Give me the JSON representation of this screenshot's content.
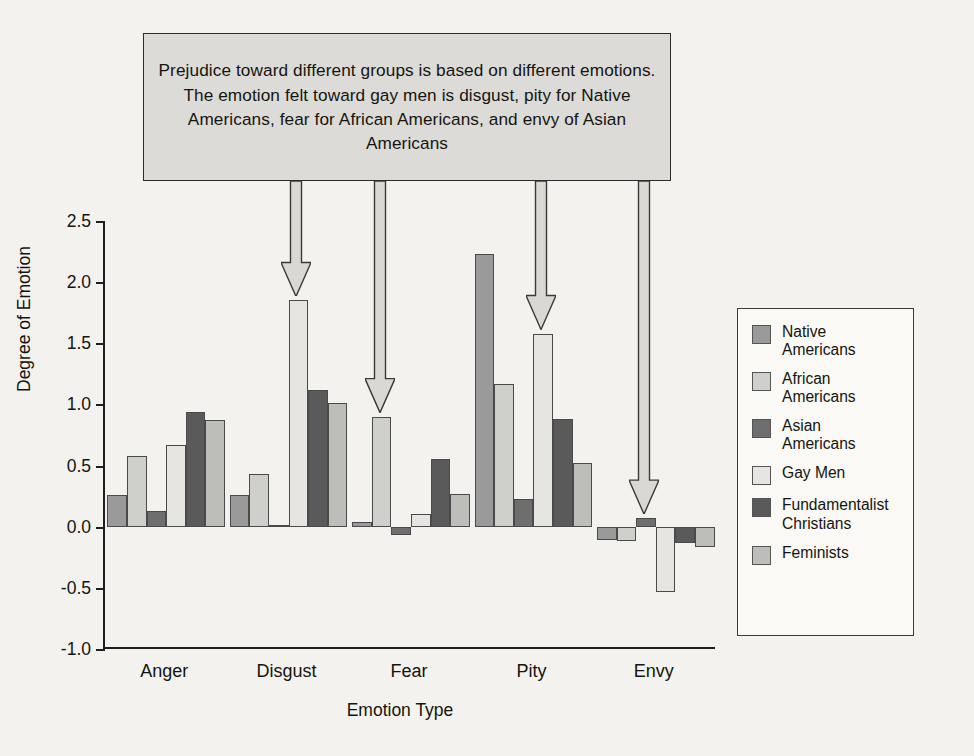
{
  "annotation": {
    "text": "Prejudice toward different groups is based on different emotions. The emotion felt toward gay men is disgust, pity for Native Americans, fear for African Americans, and envy of Asian Americans"
  },
  "legend": {
    "entries": [
      {
        "label": "Native\nAmericans",
        "color": "#9a9a9a"
      },
      {
        "label": "African\nAmericans",
        "color": "#cfcfcb"
      },
      {
        "label": "Asian\nAmericans",
        "color": "#6e6e6e"
      },
      {
        "label": "Gay Men",
        "color": "#e6e5e1"
      },
      {
        "label": "Fundamentalist\nChristians",
        "color": "#5a5a5a"
      },
      {
        "label": "Feminists",
        "color": "#bdbdb9"
      }
    ]
  },
  "chart_data": {
    "type": "bar",
    "title": "",
    "xlabel": "Emotion Type",
    "ylabel": "Degree of Emotion",
    "ylim": [
      -1.0,
      2.5
    ],
    "yticks": [
      2.5,
      2.0,
      1.5,
      1.0,
      0.5,
      0.0,
      -0.5,
      -1.0
    ],
    "ytick_labels": [
      "2.5",
      "2.0",
      "1.5",
      "1.0",
      "0.5",
      "0.0",
      "-0.5",
      "-1.0"
    ],
    "grid": false,
    "legend_position": "right",
    "categories": [
      "Anger",
      "Disgust",
      "Fear",
      "Pity",
      "Envy"
    ],
    "series": [
      {
        "name": "Native Americans",
        "color": "#9a9a9a",
        "values": [
          0.26,
          0.26,
          0.04,
          2.23,
          -0.11
        ]
      },
      {
        "name": "African Americans",
        "color": "#cfcfcb",
        "values": [
          0.58,
          0.43,
          0.9,
          1.17,
          -0.12
        ]
      },
      {
        "name": "Asian Americans",
        "color": "#6e6e6e",
        "values": [
          0.13,
          0.01,
          -0.07,
          0.23,
          0.07
        ]
      },
      {
        "name": "Gay Men",
        "color": "#e6e5e1",
        "values": [
          0.67,
          1.85,
          0.1,
          1.58,
          -0.53
        ]
      },
      {
        "name": "Fundamentalist Christians",
        "color": "#5a5a5a",
        "values": [
          0.94,
          1.12,
          0.55,
          0.88,
          -0.13
        ]
      },
      {
        "name": "Feminists",
        "color": "#bdbdb9",
        "values": [
          0.87,
          1.01,
          0.27,
          0.52,
          -0.17
        ]
      }
    ],
    "annotation_arrows": [
      {
        "target_category": "Disgust",
        "target_series": "Gay Men"
      },
      {
        "target_category": "Fear",
        "target_series": "African Americans"
      },
      {
        "target_category": "Pity",
        "target_series": "Gay Men"
      },
      {
        "target_category": "Envy",
        "target_series": "Asian Americans"
      }
    ]
  }
}
